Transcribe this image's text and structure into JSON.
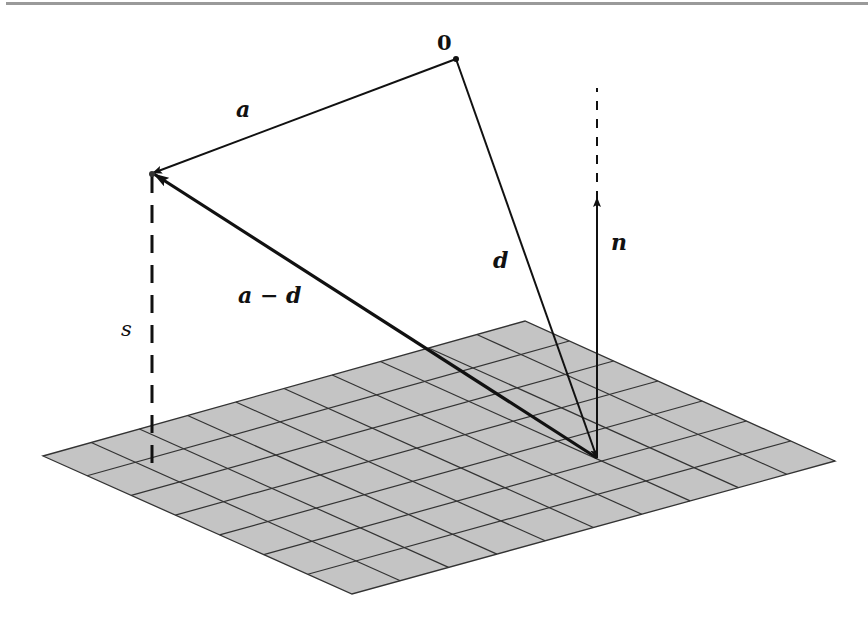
{
  "figure": {
    "type": "vector-geometry-diagram",
    "labels": {
      "origin": "0",
      "a": "a",
      "a_minus_d": "a − d",
      "d": "d",
      "n": "n",
      "s": "s"
    },
    "plane": {
      "fill": "#c4c4c4",
      "line_color": "#333333",
      "divisions_u": 10,
      "divisions_v": 7
    },
    "colors": {
      "vector": "#111111",
      "rule": "#9a9a9a"
    }
  }
}
